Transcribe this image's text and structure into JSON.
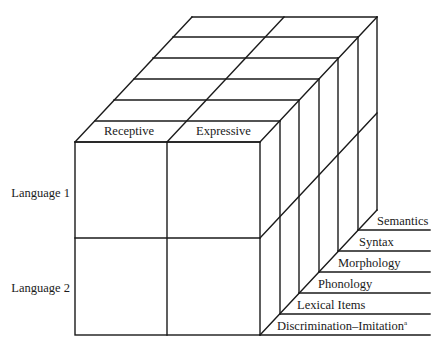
{
  "diagram": {
    "type": "3d-cube-model",
    "columns": [
      {
        "label": "Receptive"
      },
      {
        "label": "Expressive"
      }
    ],
    "rows": [
      {
        "label": "Language 1"
      },
      {
        "label": "Language 2"
      }
    ],
    "depth_levels": [
      {
        "label": "Discrimination–Imitation",
        "superscript": "a"
      },
      {
        "label": "Lexical Items"
      },
      {
        "label": "Phonology"
      },
      {
        "label": "Morphology"
      },
      {
        "label": "Syntax"
      },
      {
        "label": "Semantics"
      }
    ],
    "colors": {
      "line": "#1a1a1a",
      "background": "#ffffff",
      "text": "#1a1a1a"
    }
  }
}
